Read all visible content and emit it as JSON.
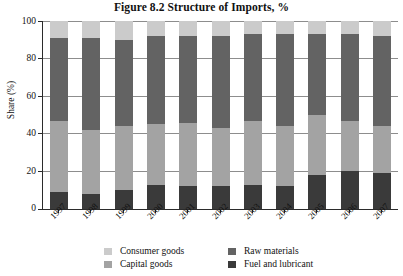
{
  "chart_data": {
    "type": "bar",
    "subtype": "stacked-bar-percent",
    "title": "Figure 8.2  Structure of Imports, %",
    "xlabel": "",
    "ylabel": "Share (%)",
    "ylim": [
      0,
      100
    ],
    "yticks": [
      0,
      20,
      40,
      60,
      80,
      100
    ],
    "grid": true,
    "legend_position": "bottom",
    "categories": [
      "1997",
      "1998",
      "1999",
      "2000",
      "2001",
      "2002",
      "2003",
      "2004",
      "2005",
      "2006",
      "2007"
    ],
    "stack_order_bottom_to_top": [
      "Fuel and lubricant",
      "Capital goods",
      "Raw materials",
      "Consumer goods"
    ],
    "series": [
      {
        "name": "Fuel and lubricant",
        "color": "#3a3a3a",
        "values": [
          9,
          8,
          10,
          13,
          12,
          12,
          13,
          12,
          18,
          20,
          19
        ]
      },
      {
        "name": "Capital goods",
        "color": "#a3a3a3",
        "values": [
          38,
          34,
          34,
          32,
          34,
          31,
          34,
          32,
          32,
          27,
          25
        ]
      },
      {
        "name": "Raw materials",
        "color": "#636363",
        "values": [
          44,
          49,
          46,
          47,
          46,
          49,
          46,
          49,
          43,
          46,
          48
        ]
      },
      {
        "name": "Consumer goods",
        "color": "#cbcbcb",
        "values": [
          9,
          9,
          10,
          8,
          8,
          8,
          7,
          7,
          7,
          7,
          8
        ]
      }
    ],
    "cumulative_tops": {
      "1997": {
        "fuel": 9,
        "capital": 47,
        "raw": 91,
        "consumer": 100
      },
      "1998": {
        "fuel": 8,
        "capital": 42,
        "raw": 91,
        "consumer": 100
      },
      "1999": {
        "fuel": 10,
        "capital": 44,
        "raw": 90,
        "consumer": 100
      },
      "2000": {
        "fuel": 13,
        "capital": 45,
        "raw": 92,
        "consumer": 100
      },
      "2001": {
        "fuel": 12,
        "capital": 46,
        "raw": 92,
        "consumer": 100
      },
      "2002": {
        "fuel": 12,
        "capital": 43,
        "raw": 92,
        "consumer": 100
      },
      "2003": {
        "fuel": 13,
        "capital": 47,
        "raw": 93,
        "consumer": 100
      },
      "2004": {
        "fuel": 12,
        "capital": 44,
        "raw": 93,
        "consumer": 100
      },
      "2005": {
        "fuel": 18,
        "capital": 50,
        "raw": 93,
        "consumer": 100
      },
      "2006": {
        "fuel": 20,
        "capital": 47,
        "raw": 93,
        "consumer": 100
      },
      "2007": {
        "fuel": 19,
        "capital": 44,
        "raw": 92,
        "consumer": 100
      }
    }
  },
  "axis": {
    "y_title": "Share (%)",
    "y_ticks": [
      "100",
      "80",
      "60",
      "40",
      "20",
      "0"
    ],
    "x_ticks": [
      "1997",
      "1998",
      "1999",
      "2000",
      "2001",
      "2002",
      "2003",
      "2004",
      "2005",
      "2006",
      "2007"
    ]
  },
  "legend": {
    "items": [
      {
        "label": "Consumer goods",
        "color": "#cbcbcb"
      },
      {
        "label": "Capital goods",
        "color": "#a3a3a3"
      },
      {
        "label": "Raw materials",
        "color": "#636363"
      },
      {
        "label": "Fuel and lubricant",
        "color": "#3a3a3a"
      }
    ]
  }
}
